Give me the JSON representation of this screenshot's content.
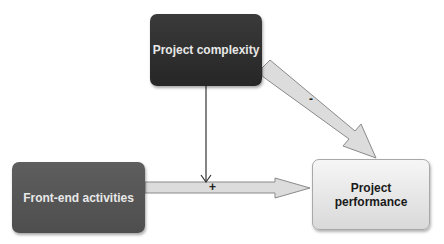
{
  "nodes": {
    "complexity": {
      "label": "Project complexity"
    },
    "frontend": {
      "label": "Front-end activities"
    },
    "performance": {
      "label": "Project performance"
    }
  },
  "edges": [
    {
      "from": "Front-end activities",
      "to": "Project performance",
      "sign": "+"
    },
    {
      "from": "Project complexity",
      "to": "Project performance",
      "sign": "-"
    },
    {
      "from": "Project complexity",
      "to": "Front-end activities → Project performance link",
      "sign": ""
    }
  ],
  "signs": {
    "positive": "+",
    "negative": "-"
  },
  "colors": {
    "dark_box": "#2e2e2e",
    "mid_box": "#555555",
    "light_box": "#e6e6e6",
    "arrow_fill": "#dcdcdc",
    "arrow_stroke": "#888888"
  }
}
